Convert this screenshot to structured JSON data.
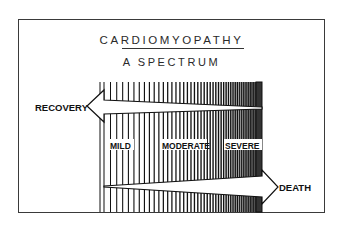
{
  "figure": {
    "title": "CARDIOMYOPATHY",
    "subtitle": "A SPECTRUM",
    "arrows": {
      "left": {
        "label": "RECOVERY",
        "direction": "left"
      },
      "right": {
        "label": "DEATH",
        "direction": "right"
      }
    },
    "severity_labels": [
      "MILD",
      "MODERATE",
      "SEVERE"
    ],
    "colors": {
      "ink": "#111111",
      "background": "#ffffff",
      "frame": "#3a3a3a"
    }
  }
}
